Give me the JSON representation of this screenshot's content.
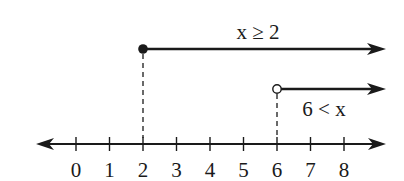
{
  "diagram": {
    "type": "number-line-inequalities",
    "axis": {
      "min_tick": 0,
      "max_tick": 8,
      "tick_labels": [
        "0",
        "1",
        "2",
        "3",
        "4",
        "5",
        "6",
        "7",
        "8"
      ],
      "arrows": "both-ends"
    },
    "rays": [
      {
        "label": "x ≥ 2",
        "start": 2,
        "endpoint": "closed",
        "direction": "right"
      },
      {
        "label": "6 < x",
        "start": 6,
        "endpoint": "open",
        "direction": "right"
      }
    ],
    "colors": {
      "ink": "#1a1a1a",
      "background": "#ffffff"
    }
  }
}
